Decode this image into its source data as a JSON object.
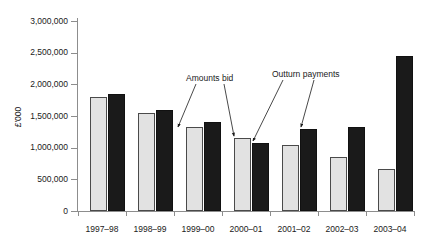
{
  "chart_data": {
    "type": "bar",
    "title": "",
    "subtitle": "",
    "xlabel": "",
    "ylabel": "£'000",
    "ylim": [
      0,
      3000000
    ],
    "grid": false,
    "legend_position": "annotations",
    "categories": [
      "1997–98",
      "1998–99",
      "1999–00",
      "2000–01",
      "2001–02",
      "2002–03",
      "2003–04"
    ],
    "ytick_labels": [
      "3,000,000",
      "2,500,000",
      "2,000,000",
      "1,500,000",
      "1,000,000",
      "500,000",
      "0"
    ],
    "ytick_values": [
      3000000,
      2500000,
      2000000,
      1500000,
      1000000,
      500000,
      0
    ],
    "series": [
      {
        "name": "Amounts bid",
        "color": "#e2e2e2",
        "values": [
          1800000,
          1540000,
          1330000,
          1150000,
          1040000,
          860000,
          660000
        ]
      },
      {
        "name": "Outturn payments",
        "color": "#1a1a1a",
        "values": [
          1850000,
          1590000,
          1400000,
          1070000,
          1290000,
          1330000,
          2450000
        ]
      }
    ],
    "annotations": [
      {
        "text": "Amounts bid",
        "points_to": [
          "1999–00 bid bar",
          "2000–01 bid bar"
        ]
      },
      {
        "text": "Outturn payments",
        "points_to": [
          "2000–01 outturn bar",
          "2001–02 outturn bar"
        ]
      }
    ]
  }
}
